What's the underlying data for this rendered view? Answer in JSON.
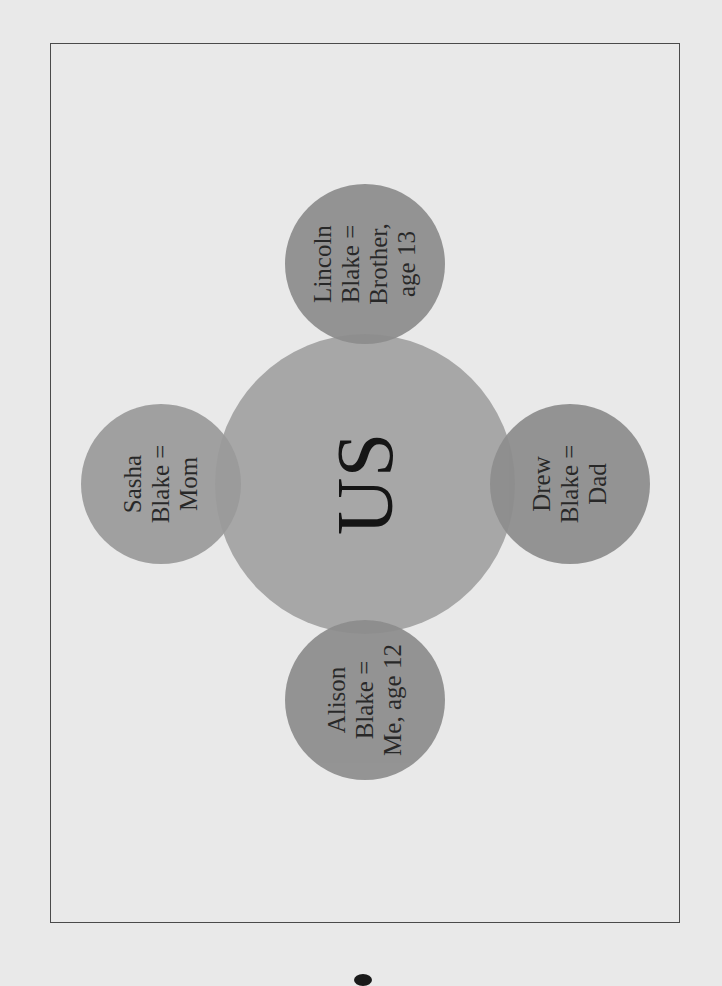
{
  "diagram": {
    "orientation": "rotated-90-ccw",
    "center": {
      "label": "US",
      "color": "#a7a7a7"
    },
    "members": [
      {
        "position": "top",
        "lines": [
          "Lincoln",
          "Blake =",
          "Brother,",
          "age 13"
        ],
        "color": "#8d8d8d"
      },
      {
        "position": "left",
        "lines": [
          "Sasha",
          "Blake =",
          "Mom"
        ],
        "color": "#9b9b9b"
      },
      {
        "position": "bottom",
        "lines": [
          "Alison",
          "Blake =",
          "Me, age 12"
        ],
        "color": "#8d8d8d"
      },
      {
        "position": "right",
        "lines": [
          "Drew",
          "Blake =",
          "Dad"
        ],
        "color": "#8d8d8d"
      }
    ],
    "frame_color": "#4a4a4a",
    "background_color": "#e9e9e9"
  }
}
